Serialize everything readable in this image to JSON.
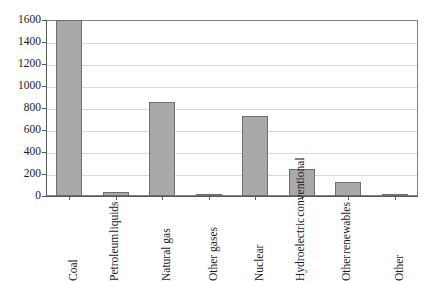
{
  "chart_data": {
    "type": "bar",
    "title": "",
    "xlabel": "",
    "ylabel": "",
    "ylim": [
      0,
      1600
    ],
    "grid": true,
    "legend": "none",
    "categories": [
      "Coal",
      "Petroleum liquids",
      "Natural gas",
      "Other gases",
      "Nuclear",
      "Hydroelectric conventional",
      "Other renewables",
      "Other"
    ],
    "category_lines": [
      [
        "Coal"
      ],
      [
        "Petroleum",
        "liquids"
      ],
      [
        "Natural gas"
      ],
      [
        "Other gases"
      ],
      [
        "Nuclear"
      ],
      [
        "Hydroelectric",
        "conventional"
      ],
      [
        "Other",
        "renewables"
      ],
      [
        "Other"
      ]
    ],
    "values": [
      1600,
      40,
      855,
      12,
      730,
      245,
      125,
      8
    ],
    "ytick_labels": [
      "1600",
      "1400",
      "1200",
      "1000",
      "800",
      "600",
      "400",
      "200",
      "0"
    ],
    "ytick_values": [
      1600,
      1400,
      1200,
      1000,
      800,
      600,
      400,
      200,
      0
    ]
  },
  "style": {
    "bar_fill": "#a9a9a9",
    "bar_border": "#6e6e6e",
    "grid_color": "#d8d8d8",
    "axis_color": "#5a5a5a",
    "text_color": "#1a1a1a",
    "background": "#ffffff"
  }
}
